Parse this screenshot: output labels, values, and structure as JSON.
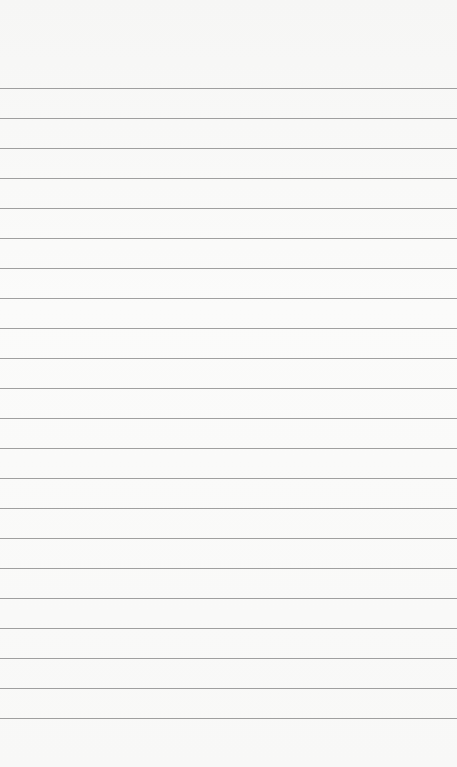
{
  "page": {
    "type": "lined-paper",
    "background_color": "#f7f7f6",
    "line_color": "#8f8f8f",
    "first_line_y": 88,
    "line_spacing": 30,
    "line_count": 22
  }
}
